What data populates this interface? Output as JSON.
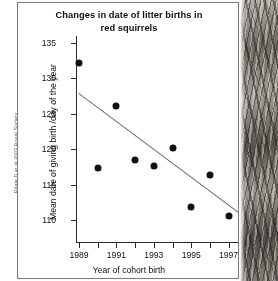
{
  "credit": {
    "text": "Réale D et al 2003 Royal Society"
  },
  "figure": {
    "photo_caption": "squirrel-photograph-strip"
  },
  "chart_data": {
    "type": "scatter",
    "title": "Changes in date of litter births in red squirrels",
    "title_line1": "Changes in date of litter births in",
    "title_line2": "red squirrels",
    "xlabel": "Year of cohort  birth",
    "ylabel": "Mean date of giving birth /day of the year",
    "xlim": [
      1988.5,
      1998.6
    ],
    "ylim": [
      107.5,
      136.5
    ],
    "grid": false,
    "legend": "none",
    "x_ticks": [
      1989,
      1990,
      1991,
      1992,
      1993,
      1994,
      1995,
      1996,
      1997,
      1998
    ],
    "x_tick_labels": [
      "1989",
      "",
      "1991",
      "",
      "1993",
      "",
      "1995",
      "",
      "1997",
      ""
    ],
    "y_ticks": [
      110,
      115,
      120,
      125,
      130,
      135
    ],
    "y_tick_labels": [
      "110",
      "115",
      "120",
      "125",
      "130",
      "135"
    ],
    "x": [
      1989,
      1990,
      1991,
      1992,
      1993,
      1994,
      1995,
      1996,
      1997,
      1998
    ],
    "y": [
      132.2,
      117.3,
      126.1,
      118.5,
      117.6,
      120.2,
      111.8,
      116.3,
      110.6,
      110.1
    ],
    "points": [
      {
        "x": 1989,
        "y": 132.2
      },
      {
        "x": 1990,
        "y": 117.3
      },
      {
        "x": 1991,
        "y": 126.1
      },
      {
        "x": 1992,
        "y": 118.5
      },
      {
        "x": 1993,
        "y": 117.6
      },
      {
        "x": 1994,
        "y": 120.2
      },
      {
        "x": 1995,
        "y": 111.8
      },
      {
        "x": 1996,
        "y": 116.3
      },
      {
        "x": 1997,
        "y": 110.6
      },
      {
        "x": 1998,
        "y": 110.1
      }
    ],
    "trendline": {
      "label": "linear regression fit",
      "x_start": 1989.0,
      "y_start": 127.9,
      "x_end": 1998.0,
      "y_end": 110.2,
      "color": "#6d6d6d"
    },
    "marker_color": "#111111",
    "axis_color": "#2b2b2b"
  }
}
